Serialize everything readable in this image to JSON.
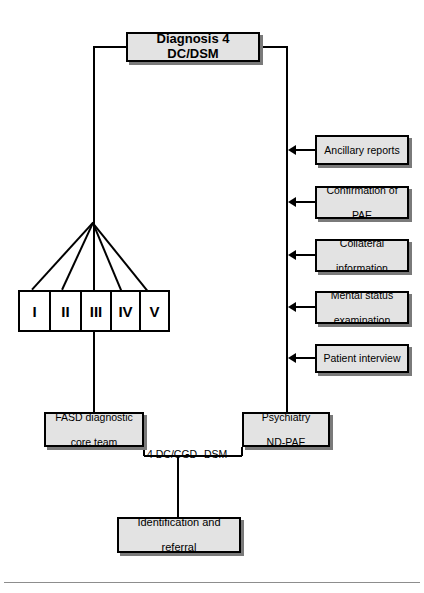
{
  "diagram": {
    "top_node": {
      "label": "Diagnosis 4 DC/DSM"
    },
    "severity_strip": {
      "name": "severity-categories",
      "cells": [
        {
          "label": "I"
        },
        {
          "label": "II"
        },
        {
          "label": "III"
        },
        {
          "label": "IV"
        },
        {
          "label": "V"
        }
      ]
    },
    "assessment_inputs": [
      {
        "label": "Ancillary reports"
      },
      {
        "label": "Confirmation of PAE",
        "line1": "Confirmation of",
        "line2": "PAE"
      },
      {
        "label": "Collateral information",
        "line1": "Collateral",
        "line2": "information"
      },
      {
        "label": "Mental status examination",
        "line1": "Mental status",
        "line2": "examination"
      },
      {
        "label": "Patient interview"
      }
    ],
    "team_nodes": {
      "left": {
        "line1": "FASD diagnostic",
        "line2": "core team"
      },
      "right": {
        "line1": "Psychiatry",
        "line2": "ND-PAE"
      }
    },
    "path_labels": {
      "left": "4 DC/CGD",
      "right": "DSM"
    },
    "outcome_node": {
      "line1": "Identification and",
      "line2": "referral"
    },
    "colors": {
      "node_fill": "#e3e3e3",
      "node_border": "#000000",
      "node_shadow": "#7a7a7a",
      "line": "#000000",
      "rule": "#8d8d8d",
      "background": "#ffffff"
    }
  }
}
